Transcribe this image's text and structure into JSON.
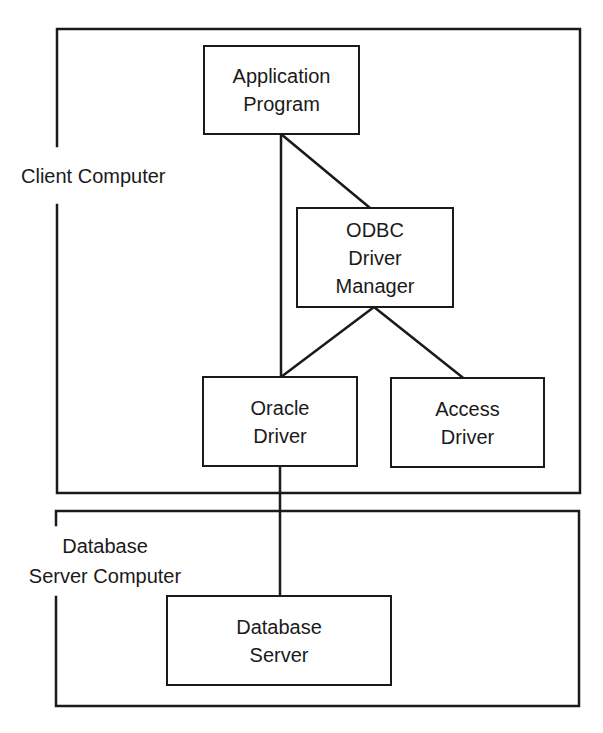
{
  "diagram": {
    "colors": {
      "stroke": "#1a1a1a",
      "background": "#ffffff"
    },
    "groups": [
      {
        "id": "client",
        "label": "Client Computer",
        "lines": [
          "Client Computer"
        ]
      },
      {
        "id": "server",
        "label": "Database Server Computer",
        "lines": [
          "Database",
          "Server Computer"
        ]
      }
    ],
    "nodes": {
      "application_program": {
        "lines": [
          "Application",
          "Program"
        ]
      },
      "odbc_driver_manager": {
        "lines": [
          "ODBC",
          "Driver",
          "Manager"
        ]
      },
      "oracle_driver": {
        "lines": [
          "Oracle",
          "Driver"
        ]
      },
      "access_driver": {
        "lines": [
          "Access",
          "Driver"
        ]
      },
      "database_server": {
        "lines": [
          "Database",
          "Server"
        ]
      }
    },
    "edges": [
      {
        "from": "Application Program",
        "to": "ODBC Driver Manager"
      },
      {
        "from": "Application Program",
        "to": "Oracle Driver"
      },
      {
        "from": "ODBC Driver Manager",
        "to": "Oracle Driver"
      },
      {
        "from": "ODBC Driver Manager",
        "to": "Access Driver"
      },
      {
        "from": "Oracle Driver",
        "to": "Database Server"
      }
    ]
  }
}
